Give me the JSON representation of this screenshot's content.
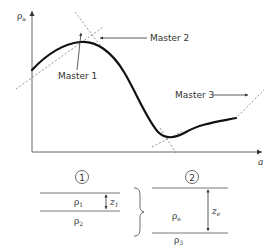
{
  "diagram": {
    "y_axis_label": "ρ",
    "y_axis_label_sub": "a",
    "x_axis_label": "a",
    "curve_color": "#111111",
    "axis_color": "#555555",
    "dashed_color": "#666666",
    "labels": {
      "master1": "Master 1",
      "master2": "Master 2",
      "master3": "Master 3"
    },
    "model1": {
      "number": "1",
      "layer_top_label": "ρ",
      "layer_top_sub": "1",
      "layer_bottom_label": "ρ",
      "layer_bottom_sub": "2",
      "thickness_label": "z",
      "thickness_sub": "1"
    },
    "model2": {
      "number": "2",
      "layer_top_label": "ρ",
      "layer_top_sub": "e",
      "layer_bottom_label": "ρ",
      "layer_bottom_sub": "3",
      "thickness_label": "z",
      "thickness_sub": "e"
    }
  }
}
